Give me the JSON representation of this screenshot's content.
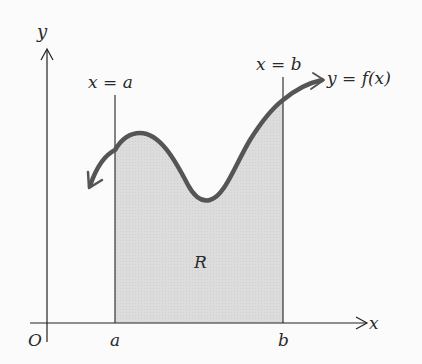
{
  "diagram": {
    "axes": {
      "x_label": "x",
      "y_label": "y",
      "origin_label": "O"
    },
    "bounds": {
      "left_line_label": "x = a",
      "right_line_label": "x = b",
      "left_tick_label": "a",
      "right_tick_label": "b"
    },
    "curve": {
      "label": "y = f(x)",
      "color": "#555555"
    },
    "region": {
      "label": "R",
      "fill": "#d9d9d9"
    }
  }
}
